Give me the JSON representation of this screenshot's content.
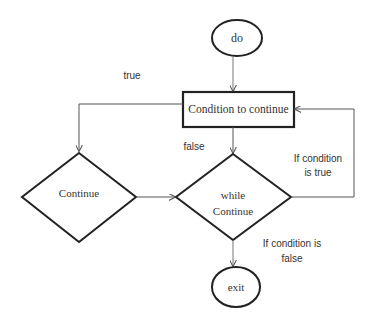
{
  "diagram": {
    "type": "flowchart",
    "nodes": {
      "start": {
        "shape": "ellipse",
        "label": "do"
      },
      "condition": {
        "shape": "rectangle",
        "label": "Condition to continue"
      },
      "continue": {
        "shape": "diamond",
        "label": "Continue"
      },
      "while": {
        "shape": "diamond",
        "label_line1": "while",
        "label_line2": "Continue"
      },
      "exit": {
        "shape": "ellipse",
        "label": "exit"
      }
    },
    "edge_labels": {
      "true": "true",
      "false": "false",
      "if_true_line1": "If condition",
      "if_true_line2": "is true",
      "if_false_line1": "If condition is",
      "if_false_line2": "false"
    },
    "edges": [
      {
        "from": "start",
        "to": "condition"
      },
      {
        "from": "condition",
        "to": "continue",
        "label": "true"
      },
      {
        "from": "condition",
        "to": "while",
        "label": "false"
      },
      {
        "from": "continue",
        "to": "while"
      },
      {
        "from": "while",
        "to": "condition",
        "label": "If condition is true"
      },
      {
        "from": "while",
        "to": "exit",
        "label": "If condition is false"
      }
    ],
    "colors": {
      "stroke": "#222222",
      "connector": "#555555",
      "text": "#333333",
      "background": "#ffffff"
    }
  }
}
